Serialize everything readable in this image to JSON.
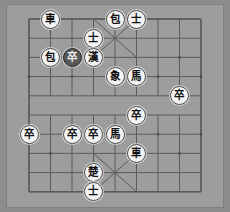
{
  "app": {
    "title": "Xiangqi Board",
    "board_background": "#9d9d9d",
    "line_color": "#5a5a5a",
    "frame_color": "#7e7e7e",
    "light_piece_color": "#f3f3f3",
    "dark_piece_color": "#585858",
    "columns": 9,
    "rows": 10
  },
  "board": {
    "name": "xiangqi-board",
    "file_count": 9,
    "rank_count": 10,
    "has_river": true,
    "palaces": [
      "top",
      "bottom"
    ]
  },
  "pieces": [
    {
      "id": "p1",
      "glyph": "車",
      "label": "chariot",
      "side": "black",
      "style": "light",
      "file": 1,
      "rank": 0,
      "selected": false
    },
    {
      "id": "p2",
      "glyph": "包",
      "label": "cannon",
      "side": "black",
      "style": "light",
      "file": 4,
      "rank": 0,
      "selected": false
    },
    {
      "id": "p3",
      "glyph": "士",
      "label": "advisor",
      "side": "black",
      "style": "light",
      "file": 5,
      "rank": 0,
      "selected": false
    },
    {
      "id": "p4",
      "glyph": "士",
      "label": "advisor",
      "side": "black",
      "style": "light",
      "file": 3,
      "rank": 1,
      "selected": false
    },
    {
      "id": "p5",
      "glyph": "包",
      "label": "cannon",
      "side": "black",
      "style": "light",
      "file": 1,
      "rank": 2,
      "selected": false
    },
    {
      "id": "p6",
      "glyph": "卒",
      "label": "soldier",
      "side": "black",
      "style": "dark",
      "file": 2,
      "rank": 2,
      "selected": true
    },
    {
      "id": "p7",
      "glyph": "漢",
      "label": "han-king",
      "side": "black",
      "style": "light",
      "file": 3,
      "rank": 2,
      "selected": false
    },
    {
      "id": "p8",
      "glyph": "象",
      "label": "elephant",
      "side": "black",
      "style": "light",
      "file": 4,
      "rank": 3,
      "selected": false
    },
    {
      "id": "p9",
      "glyph": "馬",
      "label": "horse",
      "side": "black",
      "style": "light",
      "file": 5,
      "rank": 3,
      "selected": false
    },
    {
      "id": "p10",
      "glyph": "卒",
      "label": "soldier",
      "side": "black",
      "style": "light",
      "file": 7,
      "rank": 4,
      "selected": false
    },
    {
      "id": "p11",
      "glyph": "卒",
      "label": "soldier",
      "side": "black",
      "style": "light",
      "file": 5,
      "rank": 5,
      "selected": false
    },
    {
      "id": "p12",
      "glyph": "卒",
      "label": "soldier",
      "side": "black",
      "style": "light",
      "file": 0,
      "rank": 6,
      "selected": false
    },
    {
      "id": "p13",
      "glyph": "卒",
      "label": "soldier",
      "side": "black",
      "style": "light",
      "file": 2,
      "rank": 6,
      "selected": false
    },
    {
      "id": "p14",
      "glyph": "卒",
      "label": "soldier",
      "side": "black",
      "style": "light",
      "file": 3,
      "rank": 6,
      "selected": false
    },
    {
      "id": "p15",
      "glyph": "馬",
      "label": "horse",
      "side": "black",
      "style": "light",
      "file": 4,
      "rank": 6,
      "selected": false
    },
    {
      "id": "p16",
      "glyph": "車",
      "label": "chariot",
      "side": "black",
      "style": "light",
      "file": 5,
      "rank": 7,
      "selected": false
    },
    {
      "id": "p17",
      "glyph": "楚",
      "label": "chu-king",
      "side": "black",
      "style": "light",
      "file": 3,
      "rank": 8,
      "selected": false
    },
    {
      "id": "p18",
      "glyph": "士",
      "label": "advisor",
      "side": "black",
      "style": "light",
      "file": 3,
      "rank": 9,
      "selected": false
    }
  ],
  "geometry": {
    "origin_x": 22,
    "origin_y": 14,
    "step_x": 21.5,
    "step_y": 19.2
  }
}
